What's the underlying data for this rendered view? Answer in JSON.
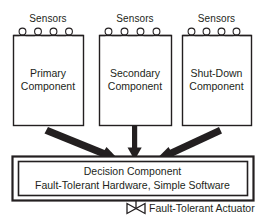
{
  "diagram": {
    "colors": {
      "stroke": "#231f20",
      "text": "#231f20",
      "background": "#ffffff"
    },
    "sensor_groups": [
      {
        "label": "Sensors",
        "count": 4
      },
      {
        "label": "Sensors",
        "count": 4
      },
      {
        "label": "Sensors",
        "count": 4
      }
    ],
    "components": [
      {
        "line1": "Primary",
        "line2": "Component"
      },
      {
        "line1": "Secondary",
        "line2": "Component"
      },
      {
        "line1": "Shut-Down",
        "line2": "Component"
      }
    ],
    "decision": {
      "line1": "Decision Component",
      "line2": "Fault-Tolerant Hardware, Simple Software"
    },
    "actuator": {
      "label": "Fault-Tolerant Actuator",
      "icon": "valve-bowtie-icon"
    },
    "arrows": [
      {
        "from": "Primary Component",
        "to": "Decision Component",
        "style": "diagonal-right-down"
      },
      {
        "from": "Secondary Component",
        "to": "Decision Component",
        "style": "vertical-down"
      },
      {
        "from": "Shut-Down Component",
        "to": "Decision Component",
        "style": "diagonal-left-down"
      }
    ]
  }
}
